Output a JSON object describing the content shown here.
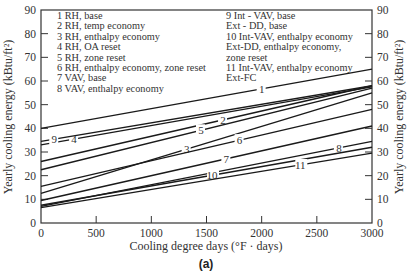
{
  "chart_data": {
    "type": "line",
    "title": "",
    "caption": "(a)",
    "xlabel": "Cooling degree days (°F · days)",
    "ylabel": "Yearly cooling energy (kBtu/ft²)",
    "ylabel_right": "Yearly cooling energy (kBtu/ft²)",
    "xlim": [
      0,
      3000
    ],
    "ylim": [
      0,
      90
    ],
    "x_ticks": [
      0,
      500,
      1000,
      1500,
      2000,
      2500,
      3000
    ],
    "y_ticks": [
      0,
      10,
      20,
      30,
      40,
      50,
      60,
      70,
      80,
      90
    ],
    "grid": false,
    "legend_position": "upper-left (in-plot text key)",
    "x": [
      0,
      3000
    ],
    "series": [
      {
        "name": "1 RH, base",
        "id": "1",
        "values": [
          40,
          65
        ]
      },
      {
        "name": "2 RH, temp economy",
        "id": "2",
        "values": [
          26,
          58
        ]
      },
      {
        "name": "3 RH, enthalpy economy",
        "id": "3",
        "values": [
          12.5,
          55
        ]
      },
      {
        "name": "4 RH, OA reset",
        "id": "4",
        "values": [
          33,
          57.5
        ]
      },
      {
        "name": "5 RH, zone reset",
        "id": "5",
        "values": [
          22.5,
          57
        ]
      },
      {
        "name": "6 RH, enthalpy economy, zone reset",
        "id": "6",
        "values": [
          15.5,
          48
        ]
      },
      {
        "name": "7 VAV, base",
        "id": "7",
        "values": [
          9.5,
          41
        ]
      },
      {
        "name": "8 VAV, enthalpy economy",
        "id": "8",
        "values": [
          7,
          34.5
        ]
      },
      {
        "name": "9 Int - VAV, base / Ext - DD, base",
        "id": "9",
        "values": [
          34.5,
          58
        ]
      },
      {
        "name": "10 Int-VAV, enthalpy economy / Ext-DD, enthalpy economy, zone reset",
        "id": "10",
        "values": [
          7.5,
          32
        ]
      },
      {
        "name": "11 Int-VAV, enthalpy economy / Ext-FC",
        "id": "11",
        "values": [
          6.5,
          29.5
        ]
      }
    ]
  },
  "legend_left": [
    "1  RH, base",
    "2  RH, temp economy",
    "3  RH, enthalpy economy",
    "4  RH, OA reset",
    "5  RH, zone reset",
    "6  RH, enthalpy economy, zone reset",
    "7  VAV, base",
    "8  VAV, enthalpy economy"
  ],
  "legend_right": [
    "9  Int - VAV, base",
    "    Ext - DD, base",
    "10 Int-VAV, enthalpy economy",
    "    Ext-DD,  enthalpy economy,",
    "    zone reset",
    "11 Int-VAV, enthalpy economy",
    "    Ext-FC"
  ]
}
